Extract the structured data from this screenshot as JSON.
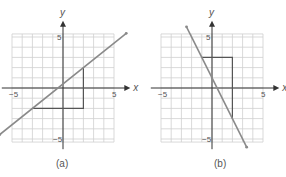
{
  "panels": [
    {
      "id": "a",
      "caption": "(a)",
      "x_label": "x",
      "y_label": "y",
      "ticks": {
        "x_min": "−5",
        "x_max": "5",
        "y_max": "5",
        "y_min": "−5"
      },
      "line": {
        "slope": 0.8,
        "intercept": 0.4,
        "from": [
          -6.2,
          -4.56
        ],
        "to": [
          6.2,
          5.36
        ]
      },
      "triangle": [
        [
          -3,
          -2
        ],
        [
          2,
          -2
        ],
        [
          2,
          2
        ]
      ]
    },
    {
      "id": "b",
      "caption": "(b)",
      "x_label": "x",
      "y_label": "y",
      "ticks": {
        "x_min": "−5",
        "x_max": "5",
        "y_max": "5",
        "y_min": "−5"
      },
      "line": {
        "slope": -2,
        "intercept": 1,
        "from": [
          -2.5,
          6
        ],
        "to": [
          3.4,
          -5.8
        ]
      },
      "triangle": [
        [
          -1,
          3
        ],
        [
          2,
          3
        ],
        [
          2,
          -3
        ]
      ]
    }
  ],
  "colors": {
    "grid": "#cfcfcf",
    "axis": "#333333",
    "line": "#8a8a8a",
    "triangle": "#555555",
    "text": "#555555"
  }
}
